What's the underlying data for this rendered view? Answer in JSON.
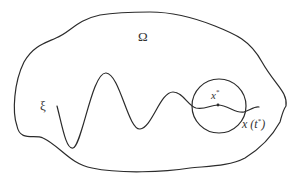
{
  "diagram": {
    "labels": {
      "domain": "Ω",
      "trajectory": "ξ",
      "point": "x",
      "point_sup": "*",
      "trajectory_point_prefix": "x (t",
      "trajectory_point_sup": "*",
      "trajectory_point_suffix": ")"
    },
    "elements": {
      "boundary": "closed irregular curve bounding domain Ω",
      "trajectory": "oscillating curve ξ with decaying amplitude",
      "neighborhood": "circle centered near x*",
      "point": "marked point x* on trajectory"
    },
    "colors": {
      "stroke": "#2b2b2b",
      "text": "#333333",
      "background": "#ffffff"
    }
  }
}
